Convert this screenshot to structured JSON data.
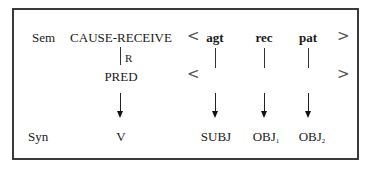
{
  "rows": {
    "sem_label": "Sem",
    "syn_label": "Syn"
  },
  "sem": {
    "predicate": "CAUSE-RECEIVE",
    "relation_label": "R",
    "pred": "PRED",
    "open_bracket": "<",
    "close_bracket": ">",
    "args": [
      "agt",
      "rec",
      "pat"
    ]
  },
  "syn": {
    "verb": "V",
    "functions": [
      {
        "base": "SUBJ",
        "sub": ""
      },
      {
        "base": "OBJ",
        "sub": "1"
      },
      {
        "base": "OBJ",
        "sub": "2"
      }
    ]
  }
}
